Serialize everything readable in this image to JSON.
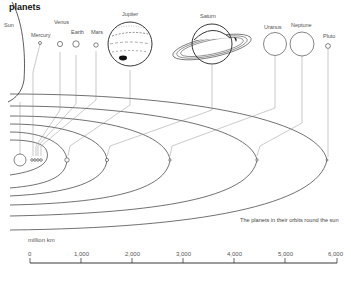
{
  "header": {
    "title": "planets"
  },
  "planets": [
    {
      "name": "Sun"
    },
    {
      "name": "Mercury"
    },
    {
      "name": "Venus"
    },
    {
      "name": "Earth"
    },
    {
      "name": "Mars"
    },
    {
      "name": "Jupiter"
    },
    {
      "name": "Saturn"
    },
    {
      "name": "Uranus"
    },
    {
      "name": "Neptune"
    },
    {
      "name": "Pluto"
    }
  ],
  "caption": "The planets in their orbits round the sun",
  "scale": {
    "unit_label": "million km",
    "ticks": [
      "0",
      "1,000",
      "2,000",
      "3,000",
      "4,000",
      "5,000",
      "6,000"
    ]
  }
}
